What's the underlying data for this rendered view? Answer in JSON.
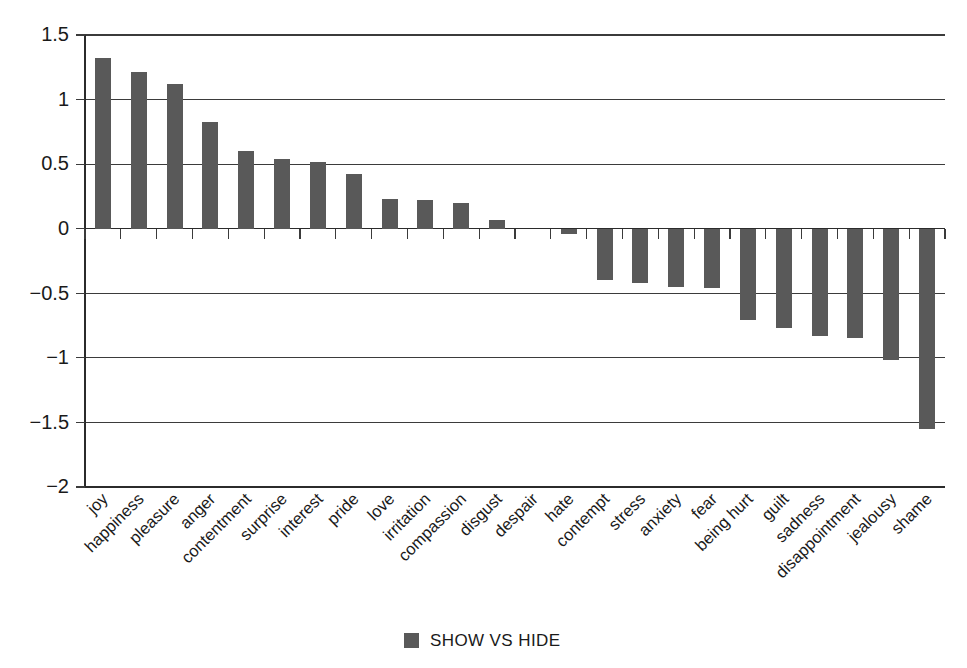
{
  "chart_data": {
    "type": "bar",
    "title": "",
    "subtitle": "",
    "xlabel": "",
    "ylabel": "",
    "ylim": [
      -2,
      1.5
    ],
    "yticks": [
      1.5,
      1,
      0.5,
      0,
      -0.5,
      -1,
      -1.5,
      -2
    ],
    "ytick_labels": [
      "1.5",
      "1",
      "0.5",
      "0",
      "−0.5",
      "−1",
      "−1.5",
      "−2"
    ],
    "grid": true,
    "grid_axis": "y",
    "legend_position": "bottom-center",
    "legend": [
      "SHOW VS HIDE"
    ],
    "bar_color": "#595959",
    "categories": [
      "joy",
      "happiness",
      "pleasure",
      "anger",
      "contentment",
      "surprise",
      "interest",
      "pride",
      "love",
      "irritation",
      "compassion",
      "disgust",
      "despair",
      "hate",
      "contempt",
      "stress",
      "anxiety",
      "fear",
      "being hurt",
      "guilt",
      "sadness",
      "disappointment",
      "jealousy",
      "shame"
    ],
    "series": [
      {
        "name": "SHOW VS HIDE",
        "color": "#595959",
        "values": [
          1.32,
          1.21,
          1.12,
          0.83,
          0.6,
          0.54,
          0.52,
          0.42,
          0.23,
          0.22,
          0.2,
          0.07,
          0.0,
          -0.04,
          -0.4,
          -0.42,
          -0.45,
          -0.46,
          -0.71,
          -0.77,
          -0.83,
          -0.85,
          -1.02,
          -1.55
        ]
      }
    ]
  },
  "legend": {
    "items": [
      {
        "label": "SHOW VS HIDE",
        "color": "#595959"
      }
    ]
  }
}
